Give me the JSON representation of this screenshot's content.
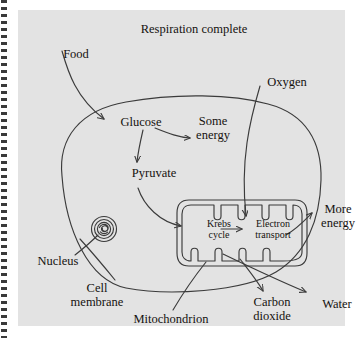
{
  "figure": {
    "title": "Respiration complete",
    "background_color": "#e3e3e3",
    "ink_color": "#3b3b3b",
    "text_color": "#15120f"
  },
  "labels": {
    "food": "Food",
    "oxygen": "Oxygen",
    "glucose": "Glucose",
    "some_energy": "Some\nenergy",
    "pyruvate": "Pyruvate",
    "krebs_cycle": "Krebs\ncycle",
    "electron_transport": "Electron\ntransport",
    "more_energy": "More\nenergy",
    "nucleus": "Nucleus",
    "cell_membrane": "Cell\nmembrane",
    "mitochondrion": "Mitochondrion",
    "carbon_dioxide": "Carbon\ndioxide",
    "water": "Water"
  },
  "structures": {
    "cell_membrane": "cell-membrane-outline",
    "nucleus": "nucleus-organelle",
    "mitochondrion": "mitochondrion-organelle",
    "cristae_top_count": 5,
    "cristae_bottom_count": 5
  },
  "flows": [
    {
      "from": "Food",
      "to": "Glucose"
    },
    {
      "from": "Glucose",
      "to": "Some energy"
    },
    {
      "from": "Glucose",
      "to": "Pyruvate"
    },
    {
      "from": "Pyruvate",
      "to": "Krebs cycle"
    },
    {
      "from": "Krebs cycle",
      "to": "Electron transport"
    },
    {
      "from": "Oxygen",
      "to": "Electron transport"
    },
    {
      "from": "Electron transport",
      "to": "More energy"
    },
    {
      "from": "Mitochondrion",
      "to": "Carbon dioxide"
    },
    {
      "from": "Mitochondrion",
      "to": "Water"
    }
  ]
}
